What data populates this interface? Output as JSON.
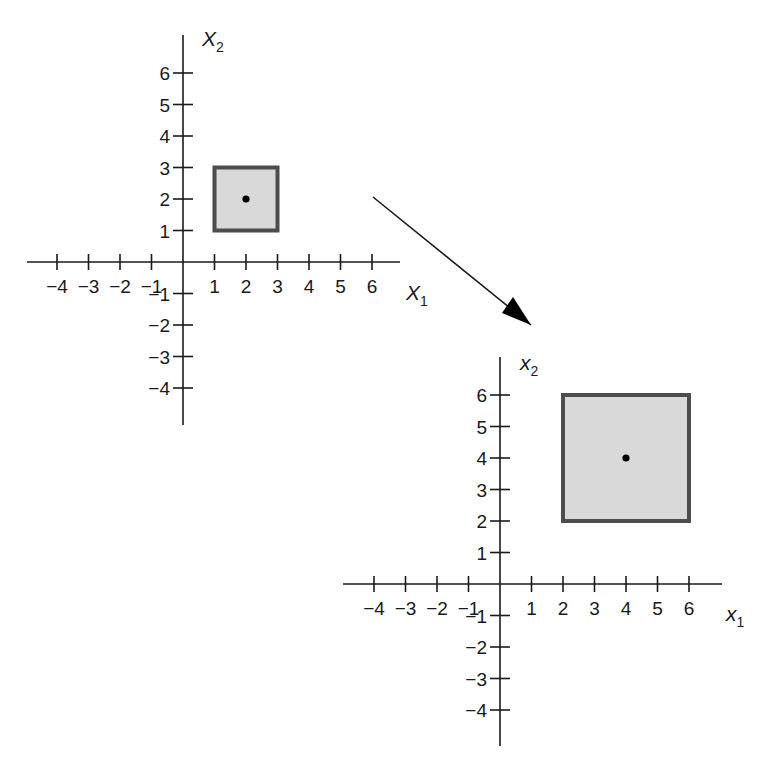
{
  "figure": {
    "background": "#ffffff",
    "axis_color": "#1a1a1a",
    "square_fill": "#d9d9d9",
    "square_stroke": "#4d4d4d",
    "point_color": "#000000"
  },
  "left_plot": {
    "x_axis_label": "X",
    "x_axis_sub": "1",
    "y_axis_label": "X",
    "y_axis_sub": "2",
    "x_ticks": [
      "-4",
      "-3",
      "-2",
      "-1",
      "1",
      "2",
      "3",
      "4",
      "5",
      "6"
    ],
    "y_ticks": [
      "6",
      "5",
      "4",
      "3",
      "2",
      "1",
      "-1",
      "-2",
      "-3",
      "-4"
    ]
  },
  "right_plot": {
    "x_axis_label": "x",
    "x_axis_sub": "1",
    "y_axis_label": "x",
    "y_axis_sub": "2",
    "x_ticks": [
      "-4",
      "-3",
      "-2",
      "-1",
      "1",
      "2",
      "3",
      "4",
      "5",
      "6"
    ],
    "y_ticks": [
      "6",
      "5",
      "4",
      "3",
      "2",
      "1",
      "-1",
      "-2",
      "-3",
      "-4"
    ]
  },
  "chart_data": [
    {
      "type": "scatter",
      "title": "Original region",
      "xlabel": "X1",
      "ylabel": "X2",
      "xlim": [
        -5,
        7
      ],
      "ylim": [
        -5,
        7
      ],
      "grid": false,
      "shapes": [
        {
          "type": "square",
          "x0": 1,
          "x1": 3,
          "y0": 1,
          "y1": 3
        }
      ],
      "points": [
        {
          "x": 2,
          "y": 2
        }
      ]
    },
    {
      "type": "scatter",
      "title": "Transformed region (scaled by 2)",
      "xlabel": "x1",
      "ylabel": "x2",
      "xlim": [
        -5,
        7
      ],
      "ylim": [
        -5,
        7
      ],
      "grid": false,
      "shapes": [
        {
          "type": "square",
          "x0": 2,
          "x1": 6,
          "y0": 2,
          "y1": 6
        }
      ],
      "points": [
        {
          "x": 4,
          "y": 4
        }
      ]
    }
  ],
  "transform_arrow": {
    "from": "left_plot",
    "to": "right_plot"
  }
}
